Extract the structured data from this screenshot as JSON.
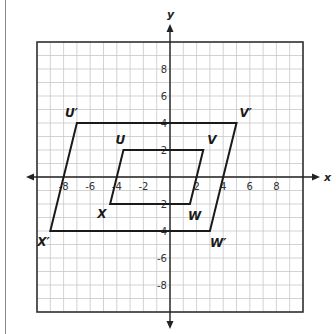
{
  "diagram": {
    "type": "coordinate-plane-dilation",
    "grid": {
      "xmin": -10,
      "xmax": 10,
      "ymin": -10,
      "ymax": 10,
      "step": 1
    },
    "axes": {
      "x_label": "x",
      "y_label": "y"
    },
    "x_ticks": [
      {
        "value": -8,
        "label": "-8"
      },
      {
        "value": -6,
        "label": "-6"
      },
      {
        "value": -4,
        "label": "-4"
      },
      {
        "value": -2,
        "label": "-2"
      },
      {
        "value": 2,
        "label": "2"
      },
      {
        "value": 4,
        "label": "4"
      },
      {
        "value": 6,
        "label": "6"
      },
      {
        "value": 8,
        "label": "8"
      }
    ],
    "y_ticks": [
      {
        "value": 8,
        "label": "8"
      },
      {
        "value": 6,
        "label": "6"
      },
      {
        "value": 4,
        "label": "4"
      },
      {
        "value": 2,
        "label": "2"
      },
      {
        "value": -2,
        "label": "2"
      },
      {
        "value": -4,
        "label": "4"
      },
      {
        "value": -6,
        "label": "-6"
      },
      {
        "value": -8,
        "label": "-8"
      }
    ],
    "shapes": [
      {
        "name": "UVWX",
        "vertices": [
          {
            "label": "U",
            "x": -3.5,
            "y": 2,
            "dx": -8,
            "dy": -6
          },
          {
            "label": "V",
            "x": 2.5,
            "y": 2,
            "dx": 4,
            "dy": -6
          },
          {
            "label": "W",
            "x": 1.5,
            "y": -2,
            "dx": -2,
            "dy": 16
          },
          {
            "label": "X",
            "x": -4.5,
            "y": -2,
            "dx": -13,
            "dy": 14
          }
        ]
      },
      {
        "name": "U'V'W'X'",
        "vertices": [
          {
            "label": "U′",
            "x": -7,
            "y": 4,
            "dx": -12,
            "dy": -6
          },
          {
            "label": "V′",
            "x": 5,
            "y": 4,
            "dx": 3,
            "dy": -6
          },
          {
            "label": "W′",
            "x": 3,
            "y": -4,
            "dx": 0,
            "dy": 16
          },
          {
            "label": "X′",
            "x": -9,
            "y": -4,
            "dx": -13,
            "dy": 15
          }
        ]
      }
    ],
    "colors": {
      "grid": "#c8c8c8",
      "axis": "#222222",
      "shape": "#1a1a1a",
      "border": "#333333"
    }
  }
}
